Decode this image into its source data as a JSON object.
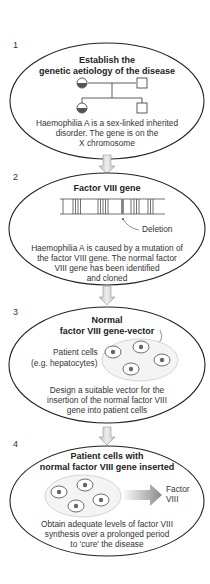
{
  "steps": [
    {
      "number": "1",
      "title_lines": [
        "Establish the",
        "genetic aetiology of the disease"
      ],
      "description_lines": [
        "Haemophilia A is a sex-linked inherited",
        "disorder. The gene is on the",
        "X chromosome"
      ],
      "icon": "pedigree-chart-icon"
    },
    {
      "number": "2",
      "title_lines": [
        "Factor VIII gene"
      ],
      "annotation": "Deletion",
      "description_lines": [
        "Haemophilia A is caused by a mutation of",
        "the factor VIII gene. The normal factor",
        "VIII gene has been identified",
        "and cloned"
      ],
      "icon": "gene-exon-map-icon"
    },
    {
      "number": "3",
      "title_lines": [
        "Normal",
        "factor VIII gene-vector"
      ],
      "cells_label_lines": [
        "Patient cells",
        "(e.g. hepatocytes)"
      ],
      "description_lines": [
        "Design a suitable vector for the",
        "insertion of the normal factor VIII",
        "gene into patient cells"
      ],
      "icon": "patient-cells-icon"
    },
    {
      "number": "4",
      "title_lines": [
        "Patient cells with",
        "normal factor VIII gene inserted"
      ],
      "product_label_lines": [
        "Factor",
        "VIII"
      ],
      "description_lines": [
        "Obtain adequate levels of factor VIII",
        "synthesis over a prolonged period",
        "to 'cure' the disease"
      ],
      "icon": "factor-output-arrow-icon"
    }
  ],
  "colors": {
    "outline": "#222222",
    "arrow_fill": "#d4d4d4",
    "cell_fill": "#ffffff",
    "nucleus_fill": "#666666",
    "cluster_fill": "#f2f2f2",
    "output_arrow": "#888888"
  }
}
